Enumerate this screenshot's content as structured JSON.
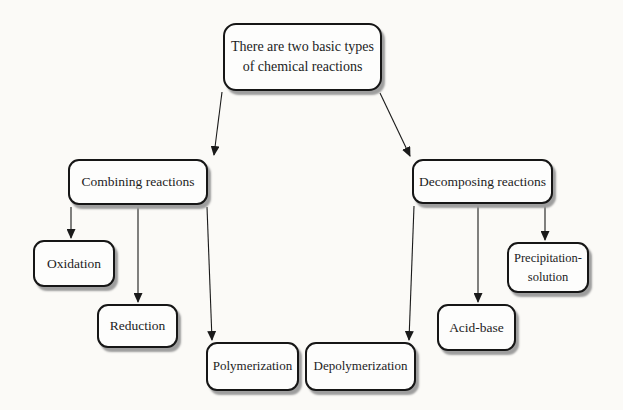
{
  "diagram": {
    "type": "flowchart",
    "nodes": {
      "root": {
        "label": "There are two basic types of chemical reactions",
        "lines": [
          "There are two basic types",
          "of chemical reactions"
        ]
      },
      "combining": {
        "label": "Combining reactions"
      },
      "decomposing": {
        "label": "Decomposing reactions"
      },
      "oxidation": {
        "label": "Oxidation"
      },
      "reduction": {
        "label": "Reduction"
      },
      "polymerization": {
        "label": "Polymerization"
      },
      "depolymerization": {
        "label": "Depolymerization"
      },
      "acid_base": {
        "label": "Acid-base"
      },
      "precipitation": {
        "label": "Precipitation-solution",
        "lines": [
          "Precipitation-",
          "solution"
        ]
      }
    },
    "edges": [
      {
        "from": "root",
        "to": "combining"
      },
      {
        "from": "root",
        "to": "decomposing"
      },
      {
        "from": "combining",
        "to": "oxidation"
      },
      {
        "from": "combining",
        "to": "reduction"
      },
      {
        "from": "combining",
        "to": "polymerization"
      },
      {
        "from": "decomposing",
        "to": "depolymerization"
      },
      {
        "from": "decomposing",
        "to": "acid_base"
      },
      {
        "from": "decomposing",
        "to": "precipitation"
      }
    ],
    "colors": {
      "background": "#fbfaf7",
      "box_fill": "#fdfdfc",
      "box_border": "#161616",
      "box_shadow": "#9e9e9e",
      "arrow": "#1a1a1a",
      "text": "#1c1c1c"
    }
  }
}
